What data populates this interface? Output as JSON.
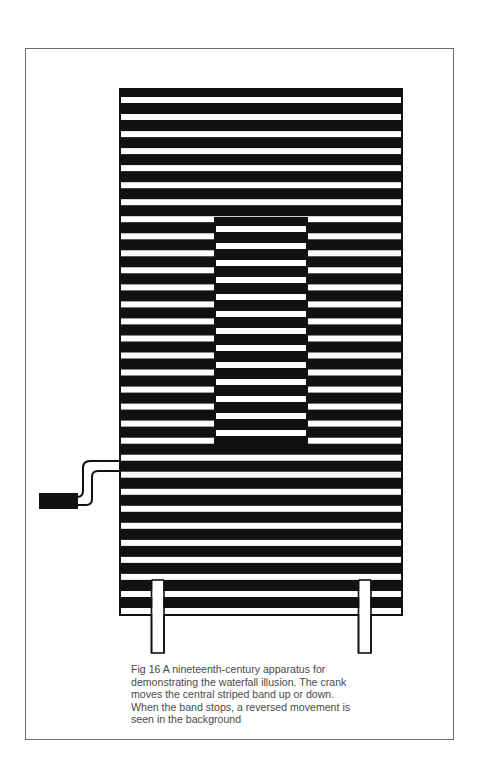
{
  "figure": {
    "label": "Fig 16",
    "title": "A nineteenth-century apparatus for demonstrating the waterfall illusion",
    "caption_lines": [
      "Fig 16  A nineteenth-century apparatus for",
      "demonstrating the waterfall illusion. The crank",
      "moves the central striped band up or down.",
      "When the band stops, a reversed movement is",
      "seen in the background"
    ],
    "colors": {
      "ink": "#111111",
      "paper": "#ffffff",
      "frame": "#6a6a6a",
      "caption_text": "#4a4a4a"
    },
    "parts": {
      "background_panel": {
        "description": "Large striped panel with horizontal white bars on black",
        "stripe_count": 31
      },
      "central_band": {
        "description": "Central striped band, moved by the crank",
        "stripe_count": 13
      },
      "crank": {
        "description": "Crank handle attached at left side"
      },
      "legs": {
        "description": "Two supporting legs",
        "count": 2
      }
    }
  }
}
